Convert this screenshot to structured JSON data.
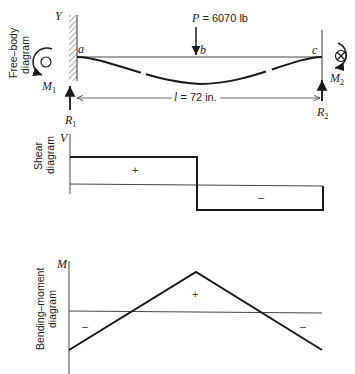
{
  "free_body": {
    "side_label_line1": "Free–body",
    "side_label_line2": "diagram",
    "wall_label": "Y",
    "points": {
      "a": "a",
      "b": "b",
      "c": "c"
    },
    "load": {
      "symbol": "P",
      "text": " = 6070 lb",
      "value_lb": 6070
    },
    "moments": {
      "left": "M",
      "left_sub": "1",
      "right": "M",
      "right_sub": "2"
    },
    "reactions": {
      "left": "R",
      "left_sub": "1",
      "right": "R",
      "right_sub": "2"
    },
    "span": {
      "symbol": "l",
      "text": " = 72 in.",
      "value_in": 72
    },
    "icons": {
      "left_moment": "counterclockwise-moment-circle-icon",
      "right_moment": "clockwise-moment-cross-icon"
    }
  },
  "shear": {
    "side_label_line1": "Shear",
    "side_label_line2": "diagram",
    "axis_label": "V",
    "positive_sign": "+",
    "negative_sign": "–"
  },
  "moment": {
    "side_label_line1": "Bending–moment",
    "side_label_line2": "diagram",
    "axis_label": "M",
    "positive_sign": "+",
    "negative_sign_left": "–",
    "negative_sign_right": "–"
  },
  "colors": {
    "line": "#1a1a1a",
    "thin_line": "#444444",
    "background": "#ffffff"
  }
}
